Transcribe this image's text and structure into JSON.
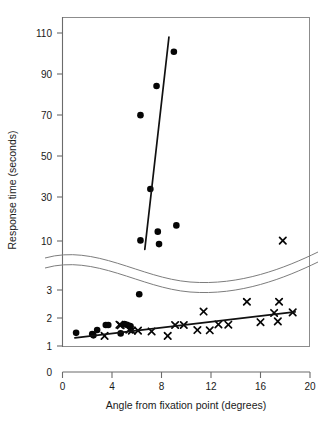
{
  "chart_data": {
    "type": "scatter",
    "title": "",
    "xlabel": "Angle from fixation point (degrees)",
    "ylabel": "Response time (seconds)",
    "xlim": [
      0,
      20
    ],
    "xticks": [
      "0",
      "4",
      "8",
      "12",
      "16",
      "20"
    ],
    "xtick_values": [
      0,
      4,
      8,
      12,
      16,
      20
    ],
    "grid": false,
    "legend_position": "none",
    "axis_break": {
      "present": true,
      "style": "wavy-double-line",
      "between": [
        3,
        10
      ],
      "note": "y-axis is broken between the lower linear segment (0-3 s) and the upper segment (10-110 s)"
    },
    "y_segments": [
      {
        "name": "upper",
        "ticks": [
          "10",
          "30",
          "50",
          "70",
          "90",
          "110"
        ],
        "tick_values": [
          10,
          30,
          50,
          70,
          90,
          110
        ],
        "range": [
          10,
          110
        ]
      },
      {
        "name": "lower",
        "ticks": [
          "0",
          "1",
          "2",
          "3"
        ],
        "tick_values": [
          0,
          1,
          2,
          3
        ],
        "range": [
          0,
          3
        ]
      }
    ],
    "series": [
      {
        "name": "filled-circles",
        "marker": "circle",
        "color": "#050505",
        "points": [
          [
            1.1,
            0.47
          ],
          [
            2.4,
            0.43
          ],
          [
            2.5,
            0.38
          ],
          [
            2.8,
            0.57
          ],
          [
            3.5,
            0.75
          ],
          [
            3.7,
            0.75
          ],
          [
            4.7,
            0.45
          ],
          [
            5.0,
            0.78
          ],
          [
            5.2,
            0.76
          ],
          [
            5.4,
            0.72
          ],
          [
            5.5,
            0.7
          ],
          [
            6.2,
            1.85
          ],
          [
            6.3,
            10.3
          ],
          [
            6.3,
            70.5
          ],
          [
            7.1,
            35.0
          ],
          [
            7.6,
            84.5
          ],
          [
            7.7,
            14.5
          ],
          [
            7.8,
            8.5
          ],
          [
            9.0,
            101.0
          ],
          [
            9.2,
            17.5
          ]
        ]
      },
      {
        "name": "x-marks",
        "marker": "x",
        "color": "#050505",
        "points": [
          [
            3.4,
            0.36
          ],
          [
            4.6,
            0.76
          ],
          [
            4.7,
            0.74
          ],
          [
            5.4,
            0.58
          ],
          [
            5.6,
            0.55
          ],
          [
            6.1,
            0.55
          ],
          [
            7.2,
            0.52
          ],
          [
            8.5,
            0.36
          ],
          [
            9.1,
            0.75
          ],
          [
            9.8,
            0.75
          ],
          [
            10.9,
            0.57
          ],
          [
            11.4,
            1.23
          ],
          [
            11.9,
            0.56
          ],
          [
            12.6,
            0.77
          ],
          [
            13.4,
            0.76
          ],
          [
            14.9,
            1.58
          ],
          [
            16.0,
            0.85
          ],
          [
            17.1,
            1.18
          ],
          [
            17.4,
            0.88
          ],
          [
            17.5,
            1.58
          ],
          [
            18.6,
            1.2
          ],
          [
            17.8,
            10.2
          ]
        ]
      }
    ],
    "fit_lines": [
      {
        "name": "upper-regression-line",
        "segment": "upper",
        "x_start": 6.65,
        "y_start": 6.0,
        "x_end": 8.6,
        "y_end": 108.0
      },
      {
        "name": "lower-regression-line",
        "segment": "lower",
        "x_start": 1.0,
        "y_start": 0.29,
        "x_end": 18.8,
        "y_end": 1.22
      }
    ]
  }
}
